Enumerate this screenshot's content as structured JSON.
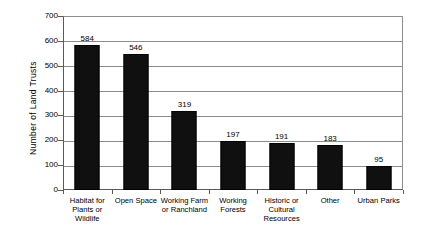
{
  "chart_data": {
    "type": "bar",
    "title": "",
    "xlabel": "",
    "ylabel": "Number of Land Trusts",
    "ylim": [
      0,
      700
    ],
    "ytick_step": 100,
    "yticks": [
      700,
      600,
      500,
      400,
      300,
      200,
      100,
      0
    ],
    "grid": true,
    "legend": "none",
    "categories": [
      "Habitat for Plants or Wildlife",
      "Open Space",
      "Working Farm or Ranchland",
      "Working Forests",
      "Historic or Cultural Resources",
      "Other",
      "Urban Parks"
    ],
    "values": [
      584,
      546,
      319,
      197,
      191,
      183,
      95
    ],
    "data_labels": [
      "584",
      "546",
      "319",
      "197",
      "191",
      "183",
      "95"
    ],
    "bar_color": "#101010",
    "gridline_color": "#8c8c8c",
    "axis_color": "#5a5a5a",
    "background_color": "#ffffff"
  },
  "axis": {
    "y_title": "Number of Land Trusts",
    "y_tick_labels": [
      "700",
      "600",
      "500",
      "400",
      "300",
      "200",
      "100",
      "0"
    ],
    "x_tick_labels": [
      "Habitat for\nPlants or\nWildlife",
      "Open Space",
      "Working Farm\nor Ranchland",
      "Working\nForests",
      "Historic or\nCultural\nResources",
      "Other",
      "Urban Parks"
    ]
  },
  "x_labels_lines": [
    [
      "Habitat for",
      "Plants or",
      "Wildlife"
    ],
    [
      "Open Space"
    ],
    [
      "Working Farm",
      "or Ranchland"
    ],
    [
      "Working",
      "Forests"
    ],
    [
      "Historic or",
      "Cultural",
      "Resources"
    ],
    [
      "Other"
    ],
    [
      "Urban Parks"
    ]
  ]
}
